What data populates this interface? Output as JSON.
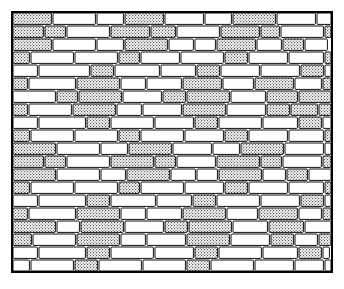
{
  "figure": {
    "style": "black and white technical line art, stippled shading",
    "background_color": "#ffffff",
    "line_color": "#000000",
    "shaded_brick_fill": "#d9d9d9",
    "plain_brick_fill": "#ffffff"
  },
  "frame": {
    "name": "wall-border-frame",
    "x": 12,
    "y": 12,
    "width": 320,
    "height": 260,
    "stroke_width": 2
  },
  "wall": {
    "bond": "running bond",
    "row_height": 13,
    "mortar_gap": 2,
    "row_count": 20,
    "unit_length": 40,
    "bricks_shaded_texture": "stipple-dots",
    "rows": [
      {
        "index": 0,
        "offset": 0,
        "bricks": [
          {
            "len": 40,
            "shaded": true
          },
          {
            "len": 44,
            "shaded": false
          },
          {
            "len": 28,
            "shaded": false
          },
          {
            "len": 40,
            "shaded": true
          },
          {
            "len": 40,
            "shaded": false
          },
          {
            "len": 28,
            "shaded": false
          },
          {
            "len": 44,
            "shaded": true
          },
          {
            "len": 40,
            "shaded": false
          },
          {
            "len": 24,
            "shaded": false
          },
          {
            "len": 28,
            "shaded": true
          }
        ]
      },
      {
        "index": 1,
        "offset": 0,
        "bricks": [
          {
            "len": 32,
            "shaded": true
          },
          {
            "len": 22,
            "shaded": true
          },
          {
            "len": 44,
            "shaded": false
          },
          {
            "len": 40,
            "shaded": true
          },
          {
            "len": 26,
            "shaded": true
          },
          {
            "len": 44,
            "shaded": false
          },
          {
            "len": 40,
            "shaded": true
          },
          {
            "len": 20,
            "shaded": true
          },
          {
            "len": 44,
            "shaded": false
          },
          {
            "len": 28,
            "shaded": true
          }
        ]
      },
      {
        "index": 2,
        "offset": 0,
        "bricks": [
          {
            "len": 40,
            "shaded": true
          },
          {
            "len": 44,
            "shaded": false
          },
          {
            "len": 28,
            "shaded": false
          },
          {
            "len": 44,
            "shaded": true
          },
          {
            "len": 26,
            "shaded": false
          },
          {
            "len": 22,
            "shaded": false
          },
          {
            "len": 40,
            "shaded": true
          },
          {
            "len": 26,
            "shaded": false
          },
          {
            "len": 22,
            "shaded": true
          },
          {
            "len": 24,
            "shaded": false
          }
        ]
      },
      {
        "index": 3,
        "offset": 4,
        "bricks": [
          {
            "len": 22,
            "shaded": true
          },
          {
            "len": 44,
            "shaded": false
          },
          {
            "len": 44,
            "shaded": false
          },
          {
            "len": 22,
            "shaded": true
          },
          {
            "len": 40,
            "shaded": false
          },
          {
            "len": 44,
            "shaded": false
          },
          {
            "len": 24,
            "shaded": true
          },
          {
            "len": 40,
            "shaded": false
          },
          {
            "len": 36,
            "shaded": false
          }
        ]
      },
      {
        "index": 4,
        "offset": 0,
        "bricks": [
          {
            "len": 26,
            "shaded": false
          },
          {
            "len": 52,
            "shaded": false
          },
          {
            "len": 24,
            "shaded": true
          },
          {
            "len": 46,
            "shaded": false
          },
          {
            "len": 36,
            "shaded": false
          },
          {
            "len": 24,
            "shaded": true
          },
          {
            "len": 40,
            "shaded": false
          },
          {
            "len": 40,
            "shaded": false
          },
          {
            "len": 24,
            "shaded": true
          },
          {
            "len": 12,
            "shaded": false
          }
        ]
      },
      {
        "index": 5,
        "offset": 4,
        "bricks": [
          {
            "len": 20,
            "shaded": true
          },
          {
            "len": 48,
            "shaded": false
          },
          {
            "len": 44,
            "shaded": true
          },
          {
            "len": 26,
            "shaded": false
          },
          {
            "len": 36,
            "shaded": false
          },
          {
            "len": 40,
            "shaded": true
          },
          {
            "len": 32,
            "shaded": false
          },
          {
            "len": 40,
            "shaded": true
          },
          {
            "len": 28,
            "shaded": false
          }
        ]
      },
      {
        "index": 6,
        "offset": 0,
        "bricks": [
          {
            "len": 44,
            "shaded": false
          },
          {
            "len": 22,
            "shaded": true
          },
          {
            "len": 44,
            "shaded": true
          },
          {
            "len": 40,
            "shaded": false
          },
          {
            "len": 24,
            "shaded": true
          },
          {
            "len": 44,
            "shaded": true
          },
          {
            "len": 36,
            "shaded": false
          },
          {
            "len": 32,
            "shaded": true
          },
          {
            "len": 38,
            "shaded": true
          }
        ]
      },
      {
        "index": 7,
        "offset": 4,
        "bricks": [
          {
            "len": 20,
            "shaded": true
          },
          {
            "len": 44,
            "shaded": false
          },
          {
            "len": 44,
            "shaded": true
          },
          {
            "len": 26,
            "shaded": false
          },
          {
            "len": 40,
            "shaded": false
          },
          {
            "len": 44,
            "shaded": true
          },
          {
            "len": 40,
            "shaded": false
          },
          {
            "len": 24,
            "shaded": true
          },
          {
            "len": 28,
            "shaded": true
          }
        ]
      },
      {
        "index": 8,
        "offset": 0,
        "bricks": [
          {
            "len": 26,
            "shaded": false
          },
          {
            "len": 48,
            "shaded": false
          },
          {
            "len": 24,
            "shaded": true
          },
          {
            "len": 44,
            "shaded": false
          },
          {
            "len": 40,
            "shaded": false
          },
          {
            "len": 24,
            "shaded": true
          },
          {
            "len": 44,
            "shaded": false
          },
          {
            "len": 36,
            "shaded": false
          },
          {
            "len": 24,
            "shaded": true
          },
          {
            "len": 10,
            "shaded": false
          }
        ]
      },
      {
        "index": 9,
        "offset": 4,
        "bricks": [
          {
            "len": 22,
            "shaded": true
          },
          {
            "len": 44,
            "shaded": false
          },
          {
            "len": 44,
            "shaded": false
          },
          {
            "len": 22,
            "shaded": true
          },
          {
            "len": 44,
            "shaded": false
          },
          {
            "len": 40,
            "shaded": false
          },
          {
            "len": 24,
            "shaded": true
          },
          {
            "len": 40,
            "shaded": false
          },
          {
            "len": 36,
            "shaded": false
          }
        ]
      },
      {
        "index": 10,
        "offset": 0,
        "bricks": [
          {
            "len": 44,
            "shaded": true
          },
          {
            "len": 44,
            "shaded": false
          },
          {
            "len": 28,
            "shaded": false
          },
          {
            "len": 44,
            "shaded": true
          },
          {
            "len": 40,
            "shaded": false
          },
          {
            "len": 28,
            "shaded": false
          },
          {
            "len": 44,
            "shaded": true
          },
          {
            "len": 40,
            "shaded": false
          },
          {
            "len": 24,
            "shaded": false
          },
          {
            "len": 24,
            "shaded": true
          }
        ]
      },
      {
        "index": 11,
        "offset": 0,
        "bricks": [
          {
            "len": 32,
            "shaded": true
          },
          {
            "len": 22,
            "shaded": true
          },
          {
            "len": 44,
            "shaded": false
          },
          {
            "len": 44,
            "shaded": true
          },
          {
            "len": 22,
            "shaded": true
          },
          {
            "len": 40,
            "shaded": false
          },
          {
            "len": 44,
            "shaded": true
          },
          {
            "len": 22,
            "shaded": true
          },
          {
            "len": 40,
            "shaded": false
          },
          {
            "len": 24,
            "shaded": true
          }
        ]
      },
      {
        "index": 12,
        "offset": 0,
        "bricks": [
          {
            "len": 44,
            "shaded": true
          },
          {
            "len": 44,
            "shaded": false
          },
          {
            "len": 26,
            "shaded": false
          },
          {
            "len": 44,
            "shaded": true
          },
          {
            "len": 26,
            "shaded": false
          },
          {
            "len": 22,
            "shaded": false
          },
          {
            "len": 44,
            "shaded": true
          },
          {
            "len": 24,
            "shaded": false
          },
          {
            "len": 22,
            "shaded": true
          },
          {
            "len": 24,
            "shaded": false
          }
        ]
      },
      {
        "index": 13,
        "offset": 4,
        "bricks": [
          {
            "len": 22,
            "shaded": true
          },
          {
            "len": 44,
            "shaded": false
          },
          {
            "len": 44,
            "shaded": false
          },
          {
            "len": 22,
            "shaded": true
          },
          {
            "len": 44,
            "shaded": false
          },
          {
            "len": 40,
            "shaded": false
          },
          {
            "len": 24,
            "shaded": true
          },
          {
            "len": 40,
            "shaded": false
          },
          {
            "len": 36,
            "shaded": false
          }
        ]
      },
      {
        "index": 14,
        "offset": 0,
        "bricks": [
          {
            "len": 26,
            "shaded": false
          },
          {
            "len": 48,
            "shaded": false
          },
          {
            "len": 24,
            "shaded": true
          },
          {
            "len": 46,
            "shaded": false
          },
          {
            "len": 36,
            "shaded": false
          },
          {
            "len": 24,
            "shaded": true
          },
          {
            "len": 44,
            "shaded": false
          },
          {
            "len": 40,
            "shaded": false
          },
          {
            "len": 24,
            "shaded": true
          },
          {
            "len": 8,
            "shaded": false
          }
        ]
      },
      {
        "index": 15,
        "offset": 4,
        "bricks": [
          {
            "len": 20,
            "shaded": true
          },
          {
            "len": 48,
            "shaded": false
          },
          {
            "len": 44,
            "shaded": true
          },
          {
            "len": 26,
            "shaded": false
          },
          {
            "len": 36,
            "shaded": false
          },
          {
            "len": 44,
            "shaded": true
          },
          {
            "len": 32,
            "shaded": false
          },
          {
            "len": 40,
            "shaded": true
          },
          {
            "len": 24,
            "shaded": false
          }
        ]
      },
      {
        "index": 16,
        "offset": 0,
        "bricks": [
          {
            "len": 44,
            "shaded": true
          },
          {
            "len": 24,
            "shaded": false
          },
          {
            "len": 44,
            "shaded": true
          },
          {
            "len": 40,
            "shaded": false
          },
          {
            "len": 24,
            "shaded": true
          },
          {
            "len": 44,
            "shaded": true
          },
          {
            "len": 36,
            "shaded": false
          },
          {
            "len": 36,
            "shaded": true
          },
          {
            "len": 28,
            "shaded": false
          }
        ]
      },
      {
        "index": 17,
        "offset": 4,
        "bricks": [
          {
            "len": 24,
            "shaded": true
          },
          {
            "len": 44,
            "shaded": false
          },
          {
            "len": 44,
            "shaded": true
          },
          {
            "len": 26,
            "shaded": false
          },
          {
            "len": 40,
            "shaded": false
          },
          {
            "len": 44,
            "shaded": true
          },
          {
            "len": 40,
            "shaded": false
          },
          {
            "len": 24,
            "shaded": true
          },
          {
            "len": 24,
            "shaded": false
          }
        ]
      },
      {
        "index": 18,
        "offset": 0,
        "bricks": [
          {
            "len": 26,
            "shaded": false
          },
          {
            "len": 48,
            "shaded": false
          },
          {
            "len": 24,
            "shaded": true
          },
          {
            "len": 44,
            "shaded": false
          },
          {
            "len": 40,
            "shaded": false
          },
          {
            "len": 24,
            "shaded": true
          },
          {
            "len": 44,
            "shaded": false
          },
          {
            "len": 36,
            "shaded": false
          },
          {
            "len": 24,
            "shaded": true
          },
          {
            "len": 8,
            "shaded": false
          }
        ]
      },
      {
        "index": 19,
        "offset": 4,
        "bricks": [
          {
            "len": 22,
            "shaded": false
          },
          {
            "len": 44,
            "shaded": false
          },
          {
            "len": 24,
            "shaded": true
          },
          {
            "len": 44,
            "shaded": false
          },
          {
            "len": 44,
            "shaded": false
          },
          {
            "len": 24,
            "shaded": true
          },
          {
            "len": 44,
            "shaded": false
          },
          {
            "len": 40,
            "shaded": false
          },
          {
            "len": 30,
            "shaded": false
          }
        ]
      }
    ]
  }
}
